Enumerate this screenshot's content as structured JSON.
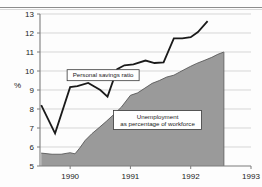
{
  "chart_data": {
    "type": "area",
    "title": "",
    "subtitle": "",
    "xlabel": "",
    "ylabel": "%",
    "ylim": [
      5,
      13
    ],
    "xlim": [
      1989.5,
      1993.0
    ],
    "grid": true,
    "legend_position": "inline-annotations",
    "y_ticks": [
      "5",
      "6",
      "7",
      "8",
      "9",
      "10",
      "11",
      "12",
      "13"
    ],
    "y_tick_values": [
      5,
      6,
      7,
      8,
      9,
      10,
      11,
      12,
      13
    ],
    "x_ticks": [
      "1990",
      "1991",
      "1992",
      "1993"
    ],
    "x_tick_values": [
      1990,
      1991,
      1992,
      1993
    ],
    "annotations": [
      {
        "name": "personal-savings-ratio-label",
        "text": "Personal savings ratio",
        "x": 1989.95,
        "y": 9.78
      },
      {
        "name": "unemployment-label",
        "line1": "Unemployment",
        "line2": "as percentage of workforce",
        "x": 1991.45,
        "y": 7.42
      }
    ],
    "series": [
      {
        "name": "Personal savings ratio",
        "type": "line",
        "color": "#1a1a1a",
        "x": [
          1989.52,
          1989.75,
          1990.0,
          1990.12,
          1990.3,
          1990.5,
          1990.62,
          1990.78,
          1990.9,
          1991.05,
          1991.25,
          1991.4,
          1991.55,
          1991.72,
          1991.86,
          1992.0,
          1992.12,
          1992.28
        ],
        "values": [
          8.2,
          6.72,
          9.15,
          9.2,
          9.37,
          9.0,
          8.65,
          10.1,
          10.3,
          10.35,
          10.55,
          10.42,
          10.45,
          11.72,
          11.72,
          11.78,
          12.05,
          12.62
        ]
      },
      {
        "name": "Unemployment as percentage of workforce",
        "type": "area",
        "fill": "#9a9a9a",
        "edge": "#4d4d4d",
        "x": [
          1989.52,
          1989.7,
          1989.85,
          1990.0,
          1990.08,
          1990.16,
          1990.25,
          1990.36,
          1990.48,
          1990.6,
          1990.72,
          1990.85,
          1991.0,
          1991.12,
          1991.24,
          1991.36,
          1991.48,
          1991.6,
          1991.72,
          1991.82,
          1991.92,
          1992.0,
          1992.1,
          1992.22,
          1992.35,
          1992.45,
          1992.55
        ],
        "values": [
          5.68,
          5.62,
          5.62,
          5.7,
          5.64,
          5.95,
          6.35,
          6.7,
          7.02,
          7.35,
          7.7,
          8.1,
          8.72,
          8.85,
          9.1,
          9.35,
          9.5,
          9.68,
          9.78,
          9.95,
          10.12,
          10.25,
          10.4,
          10.55,
          10.72,
          10.88,
          11.0
        ]
      }
    ],
    "colors": {
      "savings_line": "#1a1a1a",
      "unemployment_fill": "#9a9a9a",
      "unemployment_edge": "#4d4d4d",
      "gridline": "#c4c4c4",
      "axis": "#7d7d7d",
      "text": "#1b1b1b",
      "background": "#fdfdfd"
    }
  }
}
